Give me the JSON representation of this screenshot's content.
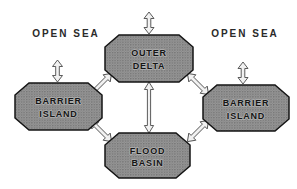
{
  "diagram": {
    "description_labels": {
      "open_sea_left": "OPEN SEA",
      "open_sea_right": "OPEN SEA"
    },
    "nodes": {
      "outer_delta": {
        "line1": "OUTER",
        "line2": "DELTA"
      },
      "barrier_island_left": {
        "line1": "BARRIER",
        "line2": "ISLAND"
      },
      "barrier_island_right": {
        "line1": "BARRIER",
        "line2": "ISLAND"
      },
      "flood_basin": {
        "line1": "FLOOD",
        "line2": "BASIN"
      }
    },
    "connections": [
      {
        "from": "outer_delta",
        "to": "open_sea",
        "bidirectional": true,
        "style": "small-vertical-arrow"
      },
      {
        "from": "barrier_island_left",
        "to": "open_sea_left",
        "bidirectional": true,
        "style": "small-vertical-arrow"
      },
      {
        "from": "barrier_island_right",
        "to": "open_sea_right",
        "bidirectional": true,
        "style": "small-vertical-arrow"
      },
      {
        "from": "outer_delta",
        "to": "flood_basin",
        "bidirectional": true,
        "style": "long-vertical-arrow"
      },
      {
        "from": "outer_delta",
        "to": "barrier_island_left",
        "bidirectional": true,
        "style": "diagonal-arrow"
      },
      {
        "from": "outer_delta",
        "to": "barrier_island_right",
        "bidirectional": true,
        "style": "diagonal-arrow"
      },
      {
        "from": "flood_basin",
        "to": "barrier_island_left",
        "bidirectional": true,
        "style": "diagonal-arrow"
      },
      {
        "from": "flood_basin",
        "to": "barrier_island_right",
        "bidirectional": true,
        "style": "diagonal-arrow"
      }
    ],
    "colors": {
      "background": "#ffffff",
      "node_fill_halftone": "#8c8c8c",
      "node_border": "#141414",
      "arrow_fill": "#f3f3f3",
      "arrow_outline": "#4a4a4a",
      "text": "#161616"
    }
  }
}
